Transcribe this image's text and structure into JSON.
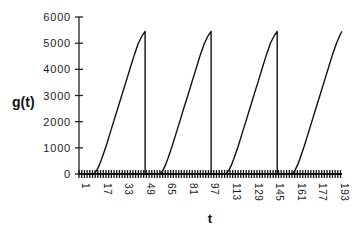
{
  "chart_data": {
    "type": "line",
    "title": "",
    "xlabel": "t",
    "ylabel": "g(t)",
    "ylim": [
      0,
      6000
    ],
    "xlim": [
      1,
      196
    ],
    "yticks": [
      0,
      1000,
      2000,
      3000,
      4000,
      5000,
      6000
    ],
    "xtick_labels": [
      "1",
      "17",
      "33",
      "49",
      "65",
      "81",
      "97",
      "113",
      "129",
      "145",
      "161",
      "177",
      "193"
    ],
    "grid": false,
    "legend": null,
    "series": [
      {
        "name": "g(t)",
        "description": "Periodic sawtooth: zero for ~11 steps, convex rise then near-linear climb to ~5450, instant drop to 0; period ≈ 49",
        "x": [
          1,
          12,
          14,
          16,
          18,
          21,
          24,
          27,
          30,
          33,
          36,
          39,
          42,
          45,
          48,
          50,
          50,
          61,
          63,
          65,
          67,
          70,
          73,
          76,
          79,
          82,
          85,
          88,
          91,
          94,
          97,
          99,
          99,
          110,
          112,
          114,
          116,
          119,
          122,
          125,
          128,
          131,
          134,
          137,
          140,
          143,
          146,
          148,
          148,
          159,
          161,
          163,
          165,
          168,
          171,
          174,
          177,
          180,
          183,
          186,
          189,
          192,
          195,
          196
        ],
        "y": [
          0,
          0,
          120,
          330,
          600,
          1050,
          1550,
          2050,
          2550,
          3050,
          3550,
          4050,
          4550,
          5000,
          5300,
          5450,
          0,
          0,
          120,
          330,
          600,
          1050,
          1550,
          2050,
          2550,
          3050,
          3550,
          4050,
          4550,
          5000,
          5300,
          5450,
          0,
          0,
          120,
          330,
          600,
          1050,
          1550,
          2050,
          2550,
          3050,
          3550,
          4050,
          4550,
          5000,
          5300,
          5450,
          0,
          0,
          120,
          330,
          600,
          1050,
          1550,
          2050,
          2550,
          3050,
          3550,
          4050,
          4550,
          5000,
          5350,
          5450
        ]
      }
    ]
  },
  "labels": {
    "ylabel": "g(t)",
    "xlabel": "t"
  }
}
